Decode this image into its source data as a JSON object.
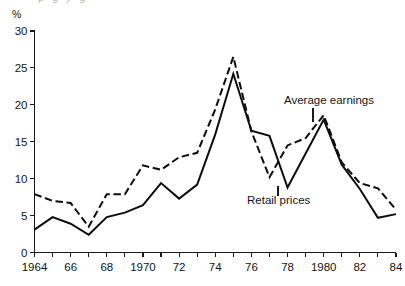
{
  "figure": {
    "background_color": "#ffffff",
    "ink_color": "#0d0d0d",
    "cropped_title_remnant": "p    g                      y          g"
  },
  "axes": {
    "y_unit_label": "%",
    "y_tick_labels": [
      "0",
      "5",
      "10",
      "15",
      "20",
      "25",
      "30"
    ],
    "x_tick_labels": [
      "1964",
      "",
      "66",
      "",
      "68",
      "",
      "1970",
      "",
      "72",
      "",
      "74",
      "",
      "76",
      "",
      "78",
      "",
      "1980",
      "",
      "82",
      "",
      "84"
    ]
  },
  "annotations": {
    "earnings_label": "Average earnings",
    "retail_label": "Retail prices"
  },
  "chart_data": {
    "type": "line",
    "title": "",
    "subtitle": "",
    "xlabel": "",
    "ylabel": "%",
    "xlim": [
      1964,
      1984
    ],
    "ylim": [
      0,
      30
    ],
    "ytick_step": 5,
    "xtick_step": 1,
    "grid": false,
    "legend_position": "inline-annotations",
    "x": [
      1964,
      1965,
      1966,
      1967,
      1968,
      1969,
      1970,
      1971,
      1972,
      1973,
      1974,
      1975,
      1976,
      1977,
      1978,
      1979,
      1980,
      1981,
      1982,
      1983,
      1984
    ],
    "series": [
      {
        "name": "Average earnings",
        "style": "dashed",
        "color": "#0d0d0d",
        "values": [
          7.9,
          7.0,
          6.7,
          3.5,
          7.9,
          7.9,
          11.8,
          11.2,
          12.9,
          13.5,
          19.4,
          26.5,
          16.4,
          10.2,
          14.5,
          15.5,
          18.6,
          12.2,
          9.4,
          8.7,
          5.8
        ]
      },
      {
        "name": "Retail prices",
        "style": "solid",
        "color": "#0d0d0d",
        "values": [
          3.1,
          4.8,
          3.9,
          2.4,
          4.8,
          5.4,
          6.4,
          9.4,
          7.3,
          9.2,
          16.0,
          24.2,
          16.5,
          15.8,
          8.8,
          13.4,
          18.0,
          11.9,
          8.6,
          4.7,
          5.2
        ]
      }
    ]
  }
}
